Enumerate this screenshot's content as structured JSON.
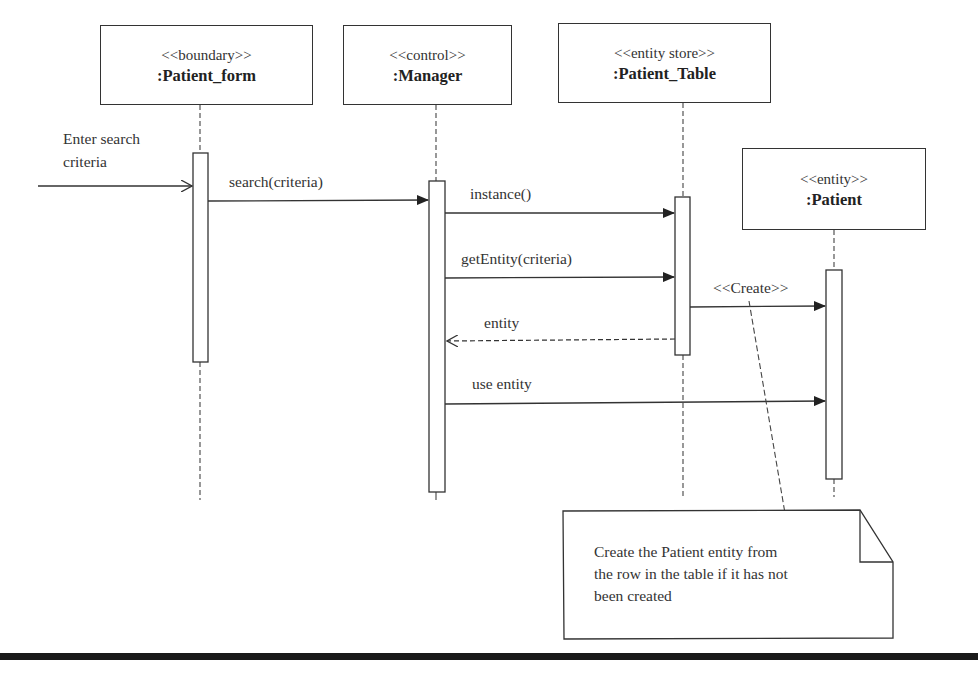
{
  "diagram": {
    "type": "UML sequence diagram",
    "objects": [
      {
        "id": "patient_form",
        "stereotype": "<<boundary>>",
        "name": ":Patient_form"
      },
      {
        "id": "manager",
        "stereotype": "<<control>>",
        "name": ":Manager"
      },
      {
        "id": "patient_table",
        "stereotype": "<<entity store>>",
        "name": ":Patient_Table"
      },
      {
        "id": "patient",
        "stereotype": "<<entity>>",
        "name": ":Patient"
      }
    ],
    "external_input": {
      "label_line1": "Enter search",
      "label_line2": "criteria",
      "to": "patient_form"
    },
    "messages": [
      {
        "label": "search(criteria)",
        "from": "patient_form",
        "to": "manager",
        "kind": "sync"
      },
      {
        "label": "instance()",
        "from": "manager",
        "to": "patient_table",
        "kind": "sync"
      },
      {
        "label": "getEntity(criteria)",
        "from": "manager",
        "to": "patient_table",
        "kind": "sync"
      },
      {
        "label": "<<Create>>",
        "from": "patient_table",
        "to": "patient",
        "kind": "create"
      },
      {
        "label": "entity",
        "from": "patient_table",
        "to": "manager",
        "kind": "return"
      },
      {
        "label": "use entity",
        "from": "manager",
        "to": "patient",
        "kind": "sync"
      }
    ],
    "note": {
      "line1": "Create the Patient entity from",
      "line2": "the row in the table if it has not",
      "line3": "been created",
      "attached_to": "<<Create>>"
    },
    "caption_partial": "... sequence diagram ... in UML"
  }
}
